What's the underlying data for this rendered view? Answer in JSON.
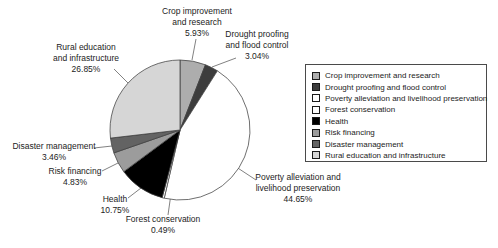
{
  "chart_data": {
    "type": "pie",
    "title": "",
    "legend_position": "right",
    "start_angle_deg": 0,
    "direction": "clockwise",
    "unit": "%",
    "slices": [
      {
        "label": "Crop improvement and research",
        "value": 5.93,
        "pct_label": "5.93%",
        "color": "#adadad",
        "callout": "Crop improvement\nand research\n5.93%"
      },
      {
        "label": "Drought proofing and flood control",
        "value": 3.04,
        "pct_label": "3.04%",
        "color": "#3d3d3d",
        "callout": "Drought proofing\nand flood control\n3.04%"
      },
      {
        "label": "Poverty alleviation and livelihood preservation",
        "value": 44.65,
        "pct_label": "44.65%",
        "color": "#ffffff",
        "callout": "Poverty alleviation and\nlivelihood preservation\n44.65%"
      },
      {
        "label": "Forest conservation",
        "value": 0.49,
        "pct_label": "0.49%",
        "color": "#ffffff",
        "callout": "Forest conservation\n0.49%"
      },
      {
        "label": "Health",
        "value": 10.75,
        "pct_label": "10.75%",
        "color": "#000000",
        "callout": "Health\n10.75%"
      },
      {
        "label": "Risk financing",
        "value": 4.83,
        "pct_label": "4.83%",
        "color": "#9c9c9c",
        "callout": "Risk financing\n4.83%"
      },
      {
        "label": "Disaster management",
        "value": 3.46,
        "pct_label": "3.46%",
        "color": "#636363",
        "callout": "Disaster management\n3.46%"
      },
      {
        "label": "Rural education and infrastructure",
        "value": 26.85,
        "pct_label": "26.85%",
        "color": "#d6d6d6",
        "callout": "Rural education\nand infrastructure\n26.85%"
      }
    ]
  }
}
